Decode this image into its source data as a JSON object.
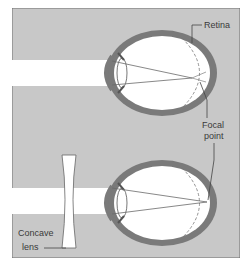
{
  "diagram": {
    "labels": {
      "retina": "Retina",
      "focal_line1": "Focal",
      "focal_line2": "point",
      "concave_line1": "Concave",
      "concave_line2": "lens"
    },
    "colors": {
      "background": "#c8c8c8",
      "panel_border": "#6e6e6e",
      "eye_wall": "#7a7a7a",
      "eye_interior": "#ffffff",
      "light_beam": "#ffffff",
      "ray_lines": "#6a6a6a",
      "label_text": "#3a3a3a"
    },
    "panels": [
      {
        "name": "uncorrected-eye",
        "description": "Light focuses in front of retina"
      },
      {
        "name": "corrected-eye",
        "description": "Concave lens moves focal point onto retina"
      }
    ]
  }
}
